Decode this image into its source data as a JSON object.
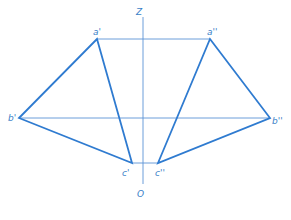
{
  "diagram": {
    "color": "#2f7bd0",
    "axis": {
      "top_label": "Z",
      "bottom_label": "O"
    },
    "points": {
      "a1": {
        "label": "a'"
      },
      "a2": {
        "label": "a''"
      },
      "b1": {
        "label": "b'"
      },
      "b2": {
        "label": "b''"
      },
      "c1": {
        "label": "c'"
      },
      "c2": {
        "label": "c''"
      }
    }
  }
}
